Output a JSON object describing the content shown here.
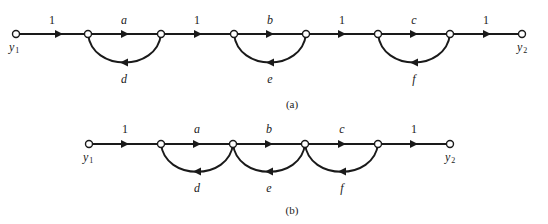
{
  "diagrams": [
    {
      "id": "a",
      "caption": "(a)",
      "source_label": {
        "name": "y",
        "sub": "1"
      },
      "sink_label": {
        "name": "y",
        "sub": "2"
      },
      "forward_gains": [
        "1",
        "a",
        "1",
        "b",
        "1",
        "c",
        "1"
      ],
      "loop_gains": [
        "d",
        "e",
        "f"
      ]
    },
    {
      "id": "b",
      "caption": "(b)",
      "source_label": {
        "name": "y",
        "sub": "1"
      },
      "sink_label": {
        "name": "y",
        "sub": "2"
      },
      "forward_gains": [
        "1",
        "a",
        "b",
        "c",
        "1"
      ],
      "loop_gains": [
        "d",
        "e",
        "f"
      ]
    }
  ],
  "colors": {
    "ink": "#1a1a1a",
    "background": "#ffffff"
  }
}
